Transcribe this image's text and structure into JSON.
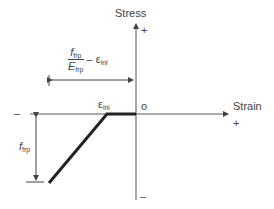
{
  "axes": {
    "y_label": "Stress",
    "x_label": "Strain",
    "y_plus": "+",
    "y_minus": "–",
    "x_plus": "+",
    "x_minus": "–",
    "origin": "o"
  },
  "annotations": {
    "top_frac_num": "f",
    "top_frac_num_sub": "frp",
    "top_frac_den": "E",
    "top_frac_den_sub": "frp",
    "top_minus_eps": "– ε",
    "top_minus_eps_sub": "ini",
    "eps_ini": "ε",
    "eps_ini_sub": "ini",
    "f_frp": "f",
    "f_frp_sub": "frp"
  },
  "colors": {
    "line": "#222222",
    "axis": "#555555"
  }
}
